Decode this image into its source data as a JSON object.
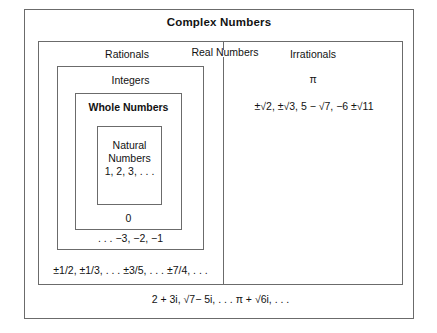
{
  "diagram": {
    "title": "Complex Numbers",
    "outer_set": {
      "name": "Complex Numbers",
      "examples": "2 + 3i, √7− 5i,  . . . π + √6i, . . ."
    },
    "real_numbers": {
      "label": "Real Numbers"
    },
    "rationals": {
      "label": "Rationals",
      "examples": "±1/2, ±1/3, . . . ±3/5, . . . ±7/4, . . ."
    },
    "integers": {
      "label": "Integers",
      "examples": ". . . −3, −2, −1"
    },
    "whole_numbers": {
      "label": "Whole Numbers",
      "examples": "0"
    },
    "natural_numbers": {
      "label_line1": "Natural",
      "label_line2": "Numbers",
      "examples": "1, 2, 3, . . ."
    },
    "irrationals": {
      "label": "Irrationals",
      "example_pi": "π",
      "examples": "±√2, ±√3, 5 − √7, −6 ±√11"
    }
  },
  "colors": {
    "border": "#6b6b6b",
    "text": "#121212",
    "background": "#ffffff"
  }
}
